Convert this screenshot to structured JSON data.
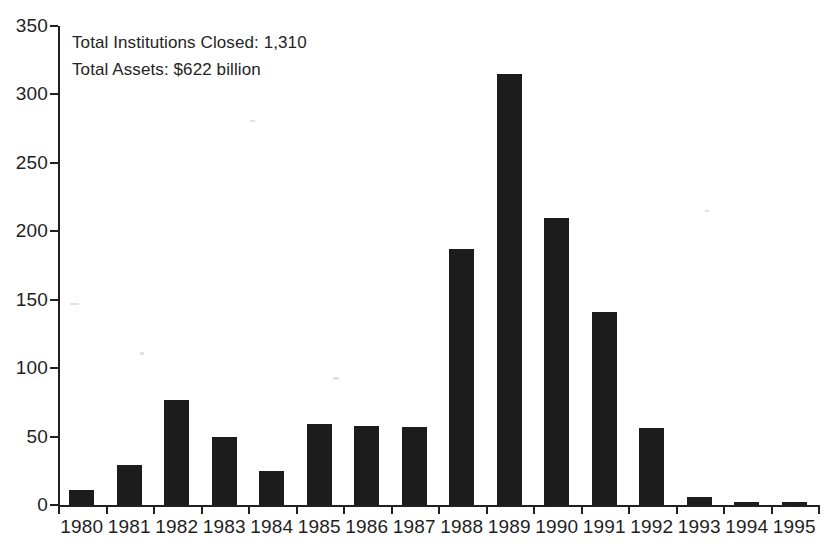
{
  "chart_data": {
    "type": "bar",
    "title": "",
    "subtitle": "",
    "xlabel": "",
    "ylabel": "",
    "categories": [
      "1980",
      "1981",
      "1982",
      "1983",
      "1984",
      "1985",
      "1986",
      "1987",
      "1988",
      "1989",
      "1990",
      "1991",
      "1992",
      "1993",
      "1994",
      "1995"
    ],
    "values": [
      11,
      29,
      77,
      50,
      25,
      59,
      58,
      57,
      187,
      315,
      210,
      141,
      56,
      6,
      2,
      2
    ],
    "series": [
      {
        "name": "Institutions closed",
        "values": [
          11,
          29,
          77,
          50,
          25,
          59,
          58,
          57,
          187,
          315,
          210,
          141,
          56,
          6,
          2,
          2
        ]
      }
    ],
    "ylim": [
      0,
      350
    ],
    "ytick_values": [
      0,
      50,
      100,
      150,
      200,
      250,
      300,
      350
    ],
    "ytick_labels": [
      "0",
      "50",
      "100",
      "150",
      "200",
      "250",
      "300",
      "350"
    ],
    "grid": false,
    "legend": null,
    "bar_color": "#1c1c1c",
    "background_color": "#ffffff",
    "axis_color": "#202020",
    "annotations": [
      "Total Institutions Closed: 1,310",
      "Total Assets: $622 billion"
    ]
  }
}
